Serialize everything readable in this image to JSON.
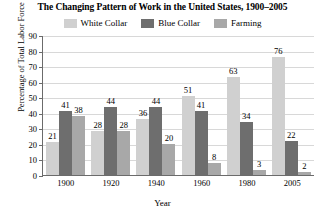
{
  "chart_data": {
    "type": "bar",
    "title": "The Changing Pattern of Work in the United States, 1900–2005",
    "xlabel": "Year",
    "ylabel": "Percentage of Total Labor Force",
    "categories": [
      "1900",
      "1920",
      "1940",
      "1960",
      "1980",
      "2005"
    ],
    "series": [
      {
        "name": "White Collar",
        "color": "#d0d0d0",
        "values": [
          21,
          28,
          36,
          51,
          63,
          76
        ]
      },
      {
        "name": "Blue Collar",
        "color": "#6e6e6e",
        "values": [
          41,
          44,
          44,
          41,
          34,
          22
        ]
      },
      {
        "name": "Farming",
        "color": "#a8a8a8",
        "values": [
          38,
          28,
          20,
          8,
          3,
          2
        ]
      }
    ],
    "ylim": [
      0,
      90
    ],
    "yticks": [
      0,
      10,
      20,
      30,
      40,
      50,
      60,
      70,
      80,
      90
    ],
    "grid": true,
    "legend_position": "top"
  }
}
